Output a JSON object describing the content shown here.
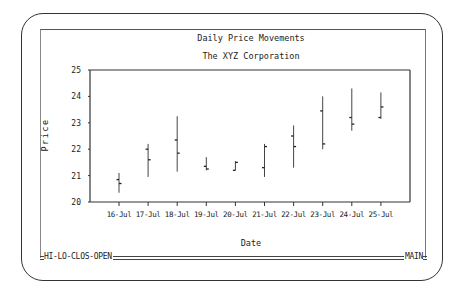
{
  "window": {
    "status_left": "HI-LO-CLOS-OPEN",
    "status_right": "MAIN"
  },
  "chart_data": {
    "type": "ohlc",
    "title": "Daily Price Movements",
    "subtitle": "The XYZ Corporation",
    "xlabel": "Date",
    "ylabel": "Price",
    "ylim": [
      20,
      25
    ],
    "yticks": [
      20,
      21,
      22,
      23,
      24,
      25
    ],
    "grid": false,
    "categories": [
      "16-Jul",
      "17-Jul",
      "18-Jul",
      "19-Jul",
      "20-Jul",
      "21-Jul",
      "22-Jul",
      "23-Jul",
      "24-Jul",
      "25-Jul"
    ],
    "series": [
      {
        "name": "High",
        "values": [
          21.1,
          22.2,
          23.25,
          21.7,
          21.55,
          22.2,
          22.9,
          24.0,
          24.3,
          24.15
        ]
      },
      {
        "name": "Low",
        "values": [
          20.35,
          20.95,
          21.15,
          21.2,
          21.2,
          20.95,
          21.3,
          22.0,
          22.7,
          23.15
        ]
      },
      {
        "name": "Close",
        "values": [
          20.7,
          21.6,
          21.85,
          21.25,
          21.5,
          22.1,
          22.1,
          22.2,
          22.95,
          23.6
        ]
      },
      {
        "name": "Open",
        "values": [
          20.85,
          22.0,
          22.35,
          21.35,
          21.2,
          21.3,
          22.5,
          23.45,
          23.2,
          23.2
        ]
      }
    ]
  }
}
